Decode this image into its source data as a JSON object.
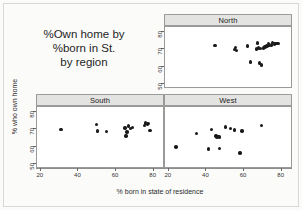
{
  "chart_data": {
    "type": "scatter",
    "title": "%Own home by %born in St. by region",
    "title_lines": [
      "%Own home by",
      "%born in St.",
      "by region"
    ],
    "xlabel": "% born in state of residence",
    "ylabel": "% who own home",
    "xlim": [
      18,
      86
    ],
    "ylim": [
      47,
      83
    ],
    "xticks": [
      20,
      40,
      60,
      80
    ],
    "yticks": [
      50,
      60,
      70,
      80
    ],
    "xtick_labels": [
      "20",
      "40",
      "60",
      "80"
    ],
    "ytick_labels": [
      "50",
      "60",
      "70",
      "80"
    ],
    "grid": false,
    "legend": "none",
    "layout": "2x2 trellis, top-left cell empty and used for title",
    "panels": [
      {
        "label": "North",
        "position": "top-right",
        "points": [
          {
            "x": 45.0,
            "y": 72.0
          },
          {
            "x": 55.5,
            "y": 69.5
          },
          {
            "x": 56.0,
            "y": 70.8
          },
          {
            "x": 56.5,
            "y": 68.8
          },
          {
            "x": 62.5,
            "y": 71.5
          },
          {
            "x": 64.0,
            "y": 62.0
          },
          {
            "x": 67.5,
            "y": 69.8
          },
          {
            "x": 68.0,
            "y": 73.5
          },
          {
            "x": 68.5,
            "y": 70.5
          },
          {
            "x": 69.0,
            "y": 61.5
          },
          {
            "x": 69.5,
            "y": 70.2
          },
          {
            "x": 70.0,
            "y": 60.2
          },
          {
            "x": 71.0,
            "y": 70.5
          },
          {
            "x": 72.0,
            "y": 71.0
          },
          {
            "x": 73.0,
            "y": 71.5
          },
          {
            "x": 74.0,
            "y": 73.0
          },
          {
            "x": 74.5,
            "y": 71.8
          },
          {
            "x": 75.5,
            "y": 72.2
          },
          {
            "x": 76.0,
            "y": 73.6
          },
          {
            "x": 77.0,
            "y": 72.8
          },
          {
            "x": 78.0,
            "y": 73.2
          },
          {
            "x": 79.0,
            "y": 73.0
          }
        ]
      },
      {
        "label": "South",
        "position": "bottom-left",
        "points": [
          {
            "x": 31.0,
            "y": 69.5
          },
          {
            "x": 50.0,
            "y": 72.5
          },
          {
            "x": 50.5,
            "y": 68.5
          },
          {
            "x": 55.5,
            "y": 68.2
          },
          {
            "x": 65.5,
            "y": 70.5
          },
          {
            "x": 66.0,
            "y": 65.5
          },
          {
            "x": 66.5,
            "y": 68.0
          },
          {
            "x": 67.5,
            "y": 71.5
          },
          {
            "x": 68.5,
            "y": 70.2
          },
          {
            "x": 69.5,
            "y": 70.8
          },
          {
            "x": 76.0,
            "y": 72.0
          },
          {
            "x": 76.5,
            "y": 73.5
          },
          {
            "x": 77.5,
            "y": 72.5
          },
          {
            "x": 78.0,
            "y": 73.2
          },
          {
            "x": 79.0,
            "y": 68.8
          }
        ]
      },
      {
        "label": "West",
        "position": "bottom-right",
        "points": [
          {
            "x": 24.0,
            "y": 59.0
          },
          {
            "x": 35.0,
            "y": 67.0
          },
          {
            "x": 41.5,
            "y": 57.8
          },
          {
            "x": 43.0,
            "y": 69.5
          },
          {
            "x": 45.5,
            "y": 65.5
          },
          {
            "x": 46.0,
            "y": 65.0
          },
          {
            "x": 46.5,
            "y": 65.2
          },
          {
            "x": 47.5,
            "y": 65.0
          },
          {
            "x": 47.5,
            "y": 58.0
          },
          {
            "x": 50.5,
            "y": 71.0
          },
          {
            "x": 53.5,
            "y": 70.0
          },
          {
            "x": 55.5,
            "y": 69.2
          },
          {
            "x": 58.5,
            "y": 55.5
          },
          {
            "x": 59.5,
            "y": 68.5
          },
          {
            "x": 70.0,
            "y": 72.0
          }
        ]
      }
    ]
  }
}
